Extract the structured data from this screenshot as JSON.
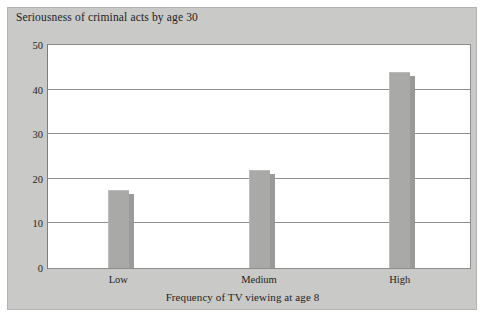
{
  "chart_data": {
    "type": "bar",
    "title": "Seriousness of criminal acts by age 30",
    "xlabel": "Frequency of TV viewing at age 8",
    "ylabel": "",
    "categories": [
      "Low",
      "Medium",
      "High"
    ],
    "values": [
      17.5,
      22,
      44
    ],
    "ylim": [
      0,
      50
    ],
    "yticks": [
      0,
      10,
      20,
      30,
      40,
      50
    ],
    "ytick_labels": [
      "0",
      "10",
      "20",
      "30",
      "40",
      "50"
    ],
    "grid": "horizontal",
    "legend": "none",
    "series": [
      {
        "name": "Seriousness of criminal acts by age 30",
        "values": [
          17.5,
          22,
          44
        ]
      }
    ]
  },
  "style": {
    "panel_background": "#c9c9c7",
    "plot_background": "#ffffff",
    "bar_color": "#a9a9a7",
    "bar_shadow_color": "#9a9a98",
    "gridline_color": "#8e8e8e",
    "text_color": "#1d1d1d"
  }
}
